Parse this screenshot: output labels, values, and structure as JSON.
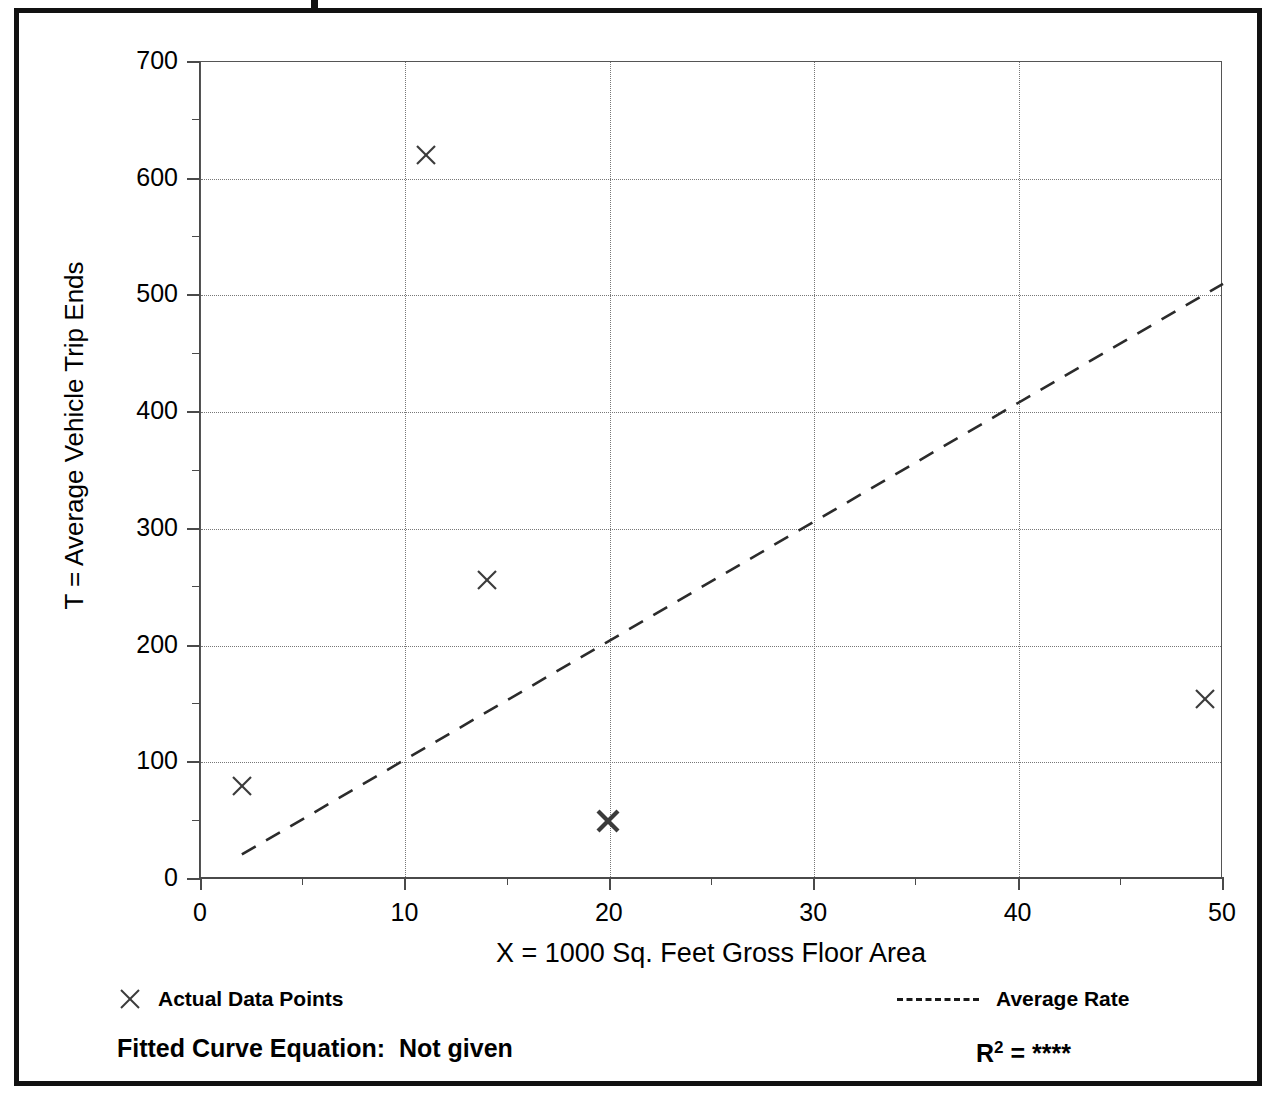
{
  "chart_data": {
    "type": "scatter",
    "title": "",
    "xlabel": "X = 1000 Sq. Feet Gross Floor Area",
    "ylabel": "T = Average Vehicle Trip Ends",
    "xlim": [
      0,
      50
    ],
    "ylim": [
      0,
      700
    ],
    "x_major_ticks": [
      0,
      10,
      20,
      30,
      40,
      50
    ],
    "y_major_ticks": [
      0,
      100,
      200,
      300,
      400,
      500,
      600,
      700
    ],
    "x_minor_ticks": [
      5,
      15,
      25,
      35,
      45
    ],
    "y_minor_ticks": [
      50,
      150,
      250,
      350,
      450,
      550,
      650
    ],
    "x_tick_labels": [
      "0",
      "10",
      "20",
      "30",
      "40",
      "50"
    ],
    "y_tick_labels": [
      "0",
      "100",
      "200",
      "300",
      "400",
      "500",
      "600",
      "700"
    ],
    "grid": true,
    "grid_style": "dotted",
    "legend_position": "below-plot",
    "series": [
      {
        "name": "Actual Data Points",
        "type": "scatter",
        "marker": "x",
        "points": [
          {
            "x": 2.0,
            "y": 80
          },
          {
            "x": 11.0,
            "y": 620
          },
          {
            "x": 14.0,
            "y": 256
          },
          {
            "x": 19.9,
            "y": 50,
            "note": "bold marker, overlapping points"
          },
          {
            "x": 49.1,
            "y": 154
          }
        ]
      },
      {
        "name": "Average Rate",
        "type": "line",
        "style": "dashed",
        "endpoints": [
          {
            "x": 2.0,
            "y": 21
          },
          {
            "x": 50.0,
            "y": 510
          }
        ]
      }
    ]
  },
  "legend": {
    "data_points_label": "Actual Data Points",
    "average_rate_label": "Average Rate",
    "marker_icon": "x-marker-icon",
    "line_icon": "dashed-line-icon"
  },
  "footer": {
    "fitted_curve_label": "Fitted Curve Equation:  Not given",
    "r_squared_prefix": "R",
    "r_squared_exponent": "2",
    "r_squared_equals": " = ",
    "r_squared_value": "****"
  },
  "colors": {
    "frame": "#111111",
    "axis": "#4a4a4a",
    "grid": "#777777",
    "marker": "#3b3b3b",
    "trendline": "#2b2b2b",
    "background": "#ffffff"
  }
}
